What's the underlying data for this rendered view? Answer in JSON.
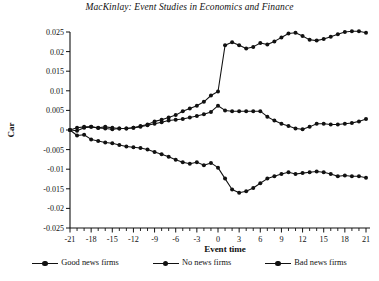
{
  "chart_data": {
    "type": "line",
    "title": "MacKinlay: Event Studies in Economics and Finance",
    "xlabel": "Event time",
    "ylabel": "Car",
    "xlim": [
      -21,
      21
    ],
    "ylim": [
      -0.025,
      0.025
    ],
    "grid": false,
    "legend_position": "bottom",
    "x": [
      -21,
      -20,
      -19,
      -18,
      -17,
      -16,
      -15,
      -14,
      -13,
      -12,
      -11,
      -10,
      -9,
      -8,
      -7,
      -6,
      -5,
      -4,
      -3,
      -2,
      -1,
      0,
      1,
      2,
      3,
      4,
      5,
      6,
      7,
      8,
      9,
      10,
      11,
      12,
      13,
      14,
      15,
      16,
      17,
      18,
      19,
      20,
      21
    ],
    "xticks": [
      -21,
      -18,
      -15,
      -12,
      -9,
      -6,
      -3,
      0,
      3,
      6,
      9,
      12,
      15,
      18,
      21
    ],
    "yticks": [
      -0.025,
      -0.02,
      -0.015,
      -0.01,
      -0.005,
      0,
      0.005,
      0.01,
      0.015,
      0.02,
      0.025
    ],
    "ytick_labels": [
      "-0.025",
      "-0.02",
      "-0.015",
      "-0.01",
      "-0.005",
      "0",
      "0.005",
      "0.01",
      "0.015",
      "0.02",
      "0.025"
    ],
    "xtick_labels": [
      "-21",
      "-18",
      "-15",
      "-12",
      "-9",
      "-6",
      "-3",
      "0",
      "3",
      "6",
      "9",
      "12",
      "15",
      "18",
      "21"
    ],
    "series": [
      {
        "name": "Good news firms",
        "marker": "circle",
        "values": [
          0.0,
          -0.0002,
          0.0006,
          0.0008,
          0.0005,
          0.0004,
          0.0002,
          0.0004,
          0.0004,
          0.0006,
          0.001,
          0.0014,
          0.0022,
          0.0026,
          0.0032,
          0.0038,
          0.0048,
          0.0055,
          0.0062,
          0.0072,
          0.0088,
          0.0098,
          0.0216,
          0.0224,
          0.0216,
          0.0208,
          0.0212,
          0.0222,
          0.0218,
          0.0226,
          0.0236,
          0.0246,
          0.0248,
          0.024,
          0.023,
          0.0228,
          0.0232,
          0.0238,
          0.0244,
          0.025,
          0.0252,
          0.0252,
          0.0248
        ]
      },
      {
        "name": "No news firms",
        "marker": "circle",
        "values": [
          0.0,
          0.0006,
          0.0008,
          0.0008,
          0.0006,
          0.0008,
          0.0006,
          0.0004,
          0.0004,
          0.0006,
          0.0008,
          0.0012,
          0.0016,
          0.002,
          0.0024,
          0.0026,
          0.0028,
          0.0032,
          0.0036,
          0.004,
          0.0046,
          0.0062,
          0.005,
          0.0048,
          0.0048,
          0.0048,
          0.0048,
          0.0048,
          0.0034,
          0.0024,
          0.0016,
          0.001,
          0.0004,
          0.0002,
          0.0008,
          0.0016,
          0.0016,
          0.0014,
          0.0014,
          0.0016,
          0.0018,
          0.0022,
          0.0028
        ]
      },
      {
        "name": "Bad news firms",
        "marker": "circle",
        "values": [
          0.0,
          -0.0014,
          -0.0012,
          -0.0024,
          -0.0028,
          -0.0032,
          -0.0034,
          -0.0038,
          -0.0042,
          -0.0044,
          -0.0046,
          -0.005,
          -0.0056,
          -0.0062,
          -0.0068,
          -0.0076,
          -0.0082,
          -0.0086,
          -0.0082,
          -0.009,
          -0.0084,
          -0.0096,
          -0.0124,
          -0.0152,
          -0.016,
          -0.0156,
          -0.0148,
          -0.0136,
          -0.0124,
          -0.0118,
          -0.0112,
          -0.0108,
          -0.0112,
          -0.011,
          -0.0108,
          -0.0106,
          -0.0108,
          -0.0112,
          -0.0118,
          -0.0116,
          -0.0118,
          -0.0118,
          -0.0122
        ]
      }
    ]
  },
  "legend": {
    "items": [
      {
        "label": "Good news firms"
      },
      {
        "label": "No news firms"
      },
      {
        "label": "Bad news firms"
      }
    ]
  },
  "colors": {
    "ink": "#111111",
    "background": "#ffffff"
  }
}
